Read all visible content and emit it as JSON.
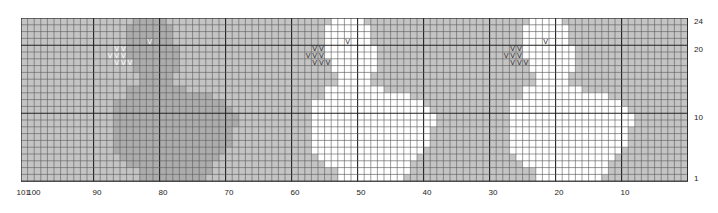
{
  "chart": {
    "type": "knitting-chart",
    "columns": 101,
    "rows": 24,
    "colors": {
      "background": "#c4c4c4",
      "motif_main": "#ffffff",
      "motif_shaded": "#acacac",
      "grid_line": "#5a5a5a",
      "grid_bold": "#222222",
      "symbol_on_white": "#333333",
      "symbol_on_gray": "#ffffff"
    },
    "symbol": "V",
    "x_labels": [
      {
        "label": "101",
        "col": 101
      },
      {
        "label": "100",
        "col": 100
      },
      {
        "label": "90",
        "col": 90
      },
      {
        "label": "80",
        "col": 80
      },
      {
        "label": "70",
        "col": 70
      },
      {
        "label": "60",
        "col": 60
      },
      {
        "label": "50",
        "col": 50
      },
      {
        "label": "40",
        "col": 40
      },
      {
        "label": "30",
        "col": 30
      },
      {
        "label": "20",
        "col": 20
      },
      {
        "label": "10",
        "col": 10
      }
    ],
    "y_labels": [
      {
        "label": "24",
        "row": 24
      },
      {
        "label": "20",
        "row": 20
      },
      {
        "label": "10",
        "row": 10
      },
      {
        "label": "1",
        "row": 1
      }
    ],
    "swan_offsets": [
      {
        "offset": 30,
        "fill": "motif_shaded",
        "symbol_color": "symbol_on_gray"
      },
      {
        "offset": 0,
        "fill": "motif_main",
        "symbol_color": "symbol_on_white"
      },
      {
        "offset": -30,
        "fill": "motif_main",
        "symbol_color": "symbol_on_white"
      }
    ],
    "swan_shape_rows": [
      {
        "row": 24,
        "from": 54,
        "to": 50
      },
      {
        "row": 23,
        "from": 55,
        "to": 49
      },
      {
        "row": 22,
        "from": 55,
        "to": 49
      },
      {
        "row": 21,
        "from": 55,
        "to": 49
      },
      {
        "row": 20,
        "from": 55,
        "to": 48
      },
      {
        "row": 19,
        "from": 55,
        "to": 48
      },
      {
        "row": 18,
        "from": 54,
        "to": 48
      },
      {
        "row": 17,
        "from": 54,
        "to": 48
      },
      {
        "row": 16,
        "from": 53,
        "to": 49
      },
      {
        "row": 15,
        "from": 53,
        "to": 49
      },
      {
        "row": 14,
        "from": 55,
        "to": 47
      },
      {
        "row": 13,
        "from": 55,
        "to": 43
      },
      {
        "row": 12,
        "from": 57,
        "to": 41
      },
      {
        "row": 11,
        "from": 57,
        "to": 40
      },
      {
        "row": 10,
        "from": 57,
        "to": 39
      },
      {
        "row": 9,
        "from": 57,
        "to": 39
      },
      {
        "row": 8,
        "from": 57,
        "to": 40
      },
      {
        "row": 7,
        "from": 57,
        "to": 40
      },
      {
        "row": 6,
        "from": 57,
        "to": 40
      },
      {
        "row": 5,
        "from": 57,
        "to": 41
      },
      {
        "row": 4,
        "from": 56,
        "to": 42
      },
      {
        "row": 3,
        "from": 55,
        "to": 43
      },
      {
        "row": 2,
        "from": 53,
        "to": 43
      },
      {
        "row": 1,
        "from": 53,
        "to": 44
      }
    ],
    "swan_symbols": [
      {
        "row": 21,
        "col": 52
      },
      {
        "row": 20,
        "col": 57
      },
      {
        "row": 20,
        "col": 56
      },
      {
        "row": 19,
        "col": 58
      },
      {
        "row": 19,
        "col": 57
      },
      {
        "row": 19,
        "col": 56
      },
      {
        "row": 18,
        "col": 57
      },
      {
        "row": 18,
        "col": 56
      },
      {
        "row": 18,
        "col": 55
      }
    ]
  }
}
